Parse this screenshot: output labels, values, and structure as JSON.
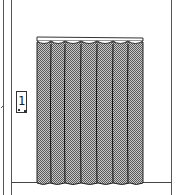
{
  "scene": {
    "title": "Changing room with curtain",
    "sign": {
      "label": "1"
    },
    "curtain": {
      "panels": 7,
      "fill_color": "#8a8a8a",
      "rod_color": "#ffffff"
    },
    "colors": {
      "line": "#333333",
      "background": "#ffffff"
    }
  }
}
